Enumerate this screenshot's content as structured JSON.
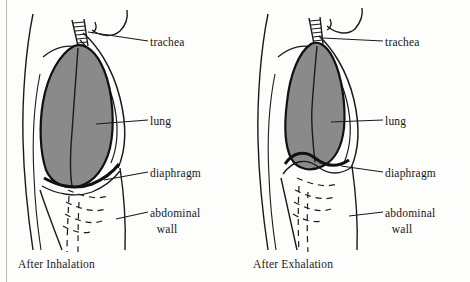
{
  "figure": {
    "type": "anatomical-diagram",
    "colors": {
      "lung_fill": "#8a8a8a",
      "outline": "#111111",
      "label_text": "#161616",
      "page_background": "#fdfdfc",
      "border_line": "#b9b9b9"
    }
  },
  "panels": [
    {
      "id": "after-inhalation",
      "caption": "After Inhalation",
      "labels": {
        "trachea": "trachea",
        "lung": "lung",
        "diaphragm": "diaphragm",
        "abdominal_wall_line1": "abdominal",
        "abdominal_wall_line2": "wall"
      }
    },
    {
      "id": "after-exhalation",
      "caption": "After Exhalation",
      "labels": {
        "trachea": "trachea",
        "lung": "lung",
        "diaphragm": "diaphragm",
        "abdominal_wall_line1": "abdominal",
        "abdominal_wall_line2": "wall"
      }
    }
  ]
}
